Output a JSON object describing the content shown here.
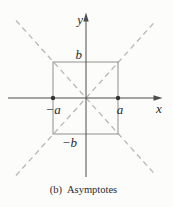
{
  "figure": {
    "caption": {
      "label": "(b)",
      "title": "Asymptotes"
    },
    "axis_labels": {
      "x": "x",
      "y": "y"
    },
    "point_labels": {
      "a": "a",
      "neg_a": "−a",
      "b": "b",
      "neg_b": "−b"
    },
    "colors": {
      "background": "#fcfcfb",
      "axis": "#4d4d4d",
      "box": "#8f8f8f",
      "asymptote": "#b7b7b7",
      "dot": "#333333",
      "text": "#2b2b2b"
    },
    "diagram": {
      "type": "coordinate-figure",
      "elements": [
        "x-axis with right arrowhead",
        "y-axis with top arrowhead",
        "central rectangle spanning x = −a..a and y = −b..b",
        "two dashed diagonal asymptote lines through the origin and the rectangle corners",
        "filled points on the x-axis at −a and a"
      ]
    }
  }
}
